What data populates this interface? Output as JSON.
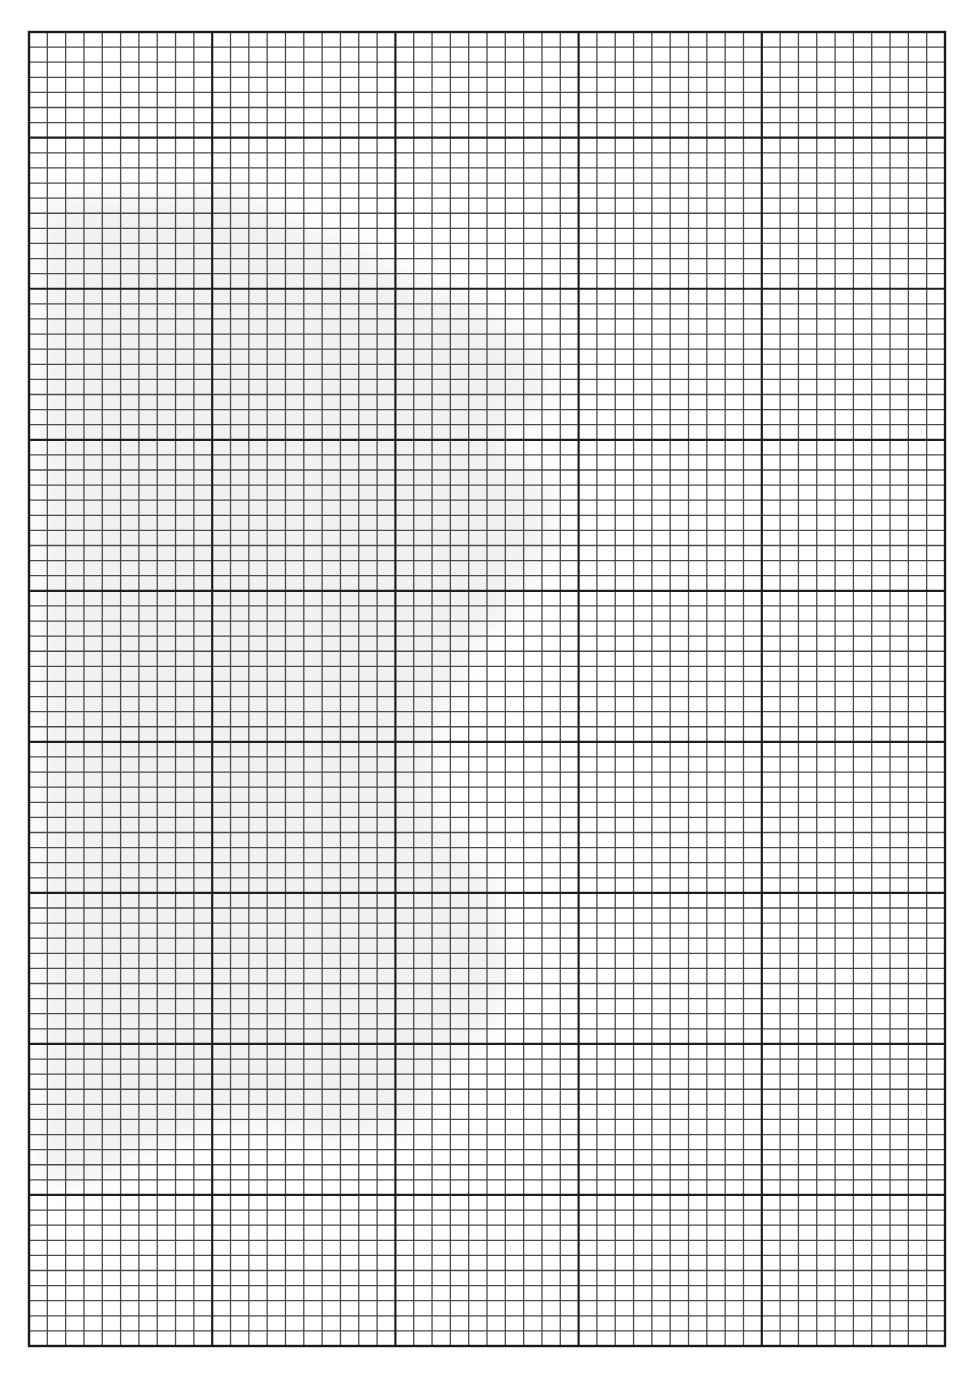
{
  "page": {
    "width": 977,
    "height": 1394,
    "background": "#ffffff"
  },
  "graph_paper": {
    "left": 29,
    "top": 32,
    "right": 945,
    "bottom": 1346,
    "columns": 50,
    "rows": 87,
    "major_every": 10,
    "column_major_offset": 0,
    "row_major_offset": 7,
    "minor_line_color": "#4a4a4a",
    "major_line_color": "#1e1e1e",
    "border_color": "#1a1a1a",
    "minor_line_width": 1.3,
    "major_line_width": 2.2,
    "border_width": 2.4
  },
  "shadow": {
    "color": "#e6e6e6",
    "opacity": 0.55,
    "description": "faint grey scan shadow in left-centre region"
  }
}
